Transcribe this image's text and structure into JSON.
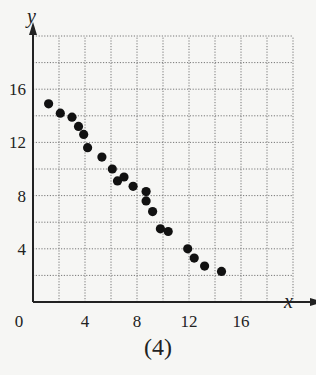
{
  "chart_data": {
    "type": "scatter",
    "title": "",
    "caption": "(4)",
    "xlabel": "x",
    "ylabel": "y",
    "xlim": [
      0,
      20
    ],
    "ylim": [
      0,
      20
    ],
    "x_ticks": [
      0,
      4,
      8,
      12,
      16
    ],
    "y_ticks": [
      4,
      8,
      12,
      16
    ],
    "grid": true,
    "grid_step": 2,
    "grid_style": "dotted",
    "legend": null,
    "series": [
      {
        "name": "points",
        "color": "#111111",
        "points": [
          {
            "x": 1.2,
            "y": 14.9
          },
          {
            "x": 2.1,
            "y": 14.2
          },
          {
            "x": 3.0,
            "y": 13.9
          },
          {
            "x": 3.5,
            "y": 13.2
          },
          {
            "x": 3.9,
            "y": 12.6
          },
          {
            "x": 4.2,
            "y": 11.6
          },
          {
            "x": 5.3,
            "y": 10.9
          },
          {
            "x": 6.1,
            "y": 10.0
          },
          {
            "x": 6.5,
            "y": 9.1
          },
          {
            "x": 7.0,
            "y": 9.4
          },
          {
            "x": 7.7,
            "y": 8.7
          },
          {
            "x": 8.7,
            "y": 8.3
          },
          {
            "x": 8.7,
            "y": 7.6
          },
          {
            "x": 9.2,
            "y": 6.8
          },
          {
            "x": 9.8,
            "y": 5.5
          },
          {
            "x": 10.4,
            "y": 5.3
          },
          {
            "x": 11.9,
            "y": 4.0
          },
          {
            "x": 12.4,
            "y": 3.3
          },
          {
            "x": 13.2,
            "y": 2.7
          },
          {
            "x": 14.5,
            "y": 2.3
          }
        ]
      }
    ]
  },
  "labels": {
    "caption": "(4)",
    "x_axis": "x",
    "y_axis": "y",
    "origin": "0"
  }
}
